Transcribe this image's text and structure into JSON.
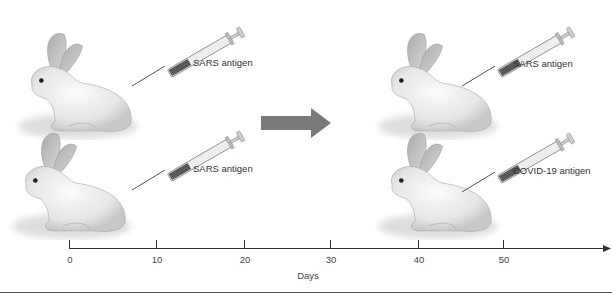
{
  "panels": {
    "top_left": {
      "label": "SARS antigen"
    },
    "bottom_left": {
      "label": "SARS antigen"
    },
    "top_right": {
      "label": "SARS antigen"
    },
    "bottom_right": {
      "label": "COVID-19 antigen"
    }
  },
  "timeline": {
    "axis_label": "Days",
    "ticks": [
      "0",
      "10",
      "20",
      "30",
      "40",
      "50"
    ]
  },
  "colors": {
    "arrow": "#7a7a7a",
    "axis": "#333333",
    "syringe_fill": "#5a5a5a",
    "bottom_rule": "#555555"
  }
}
